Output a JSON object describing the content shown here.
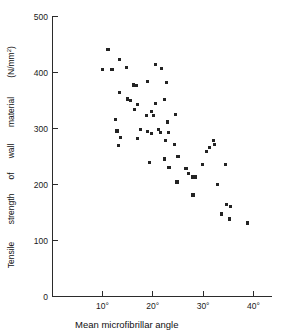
{
  "chart_data": {
    "type": "scatter",
    "title": "",
    "xlabel": "Mean microfibrillar angle",
    "ylabel": "Tensile strength of wall material (N/mm2)",
    "ylabel_words": [
      "Tensile",
      "strength",
      "of",
      "wall",
      "material",
      "(N/mm",
      "2",
      ")"
    ],
    "xtick_labels": [
      "10°",
      "20°",
      "30°",
      "40°"
    ],
    "xticks": [
      10,
      20,
      30,
      40
    ],
    "ytick_labels": [
      "0",
      "100",
      "200",
      "300",
      "400",
      "500"
    ],
    "yticks": [
      0,
      100,
      200,
      300,
      400,
      500
    ],
    "xlim": [
      5,
      42
    ],
    "ylim": [
      0,
      500
    ],
    "grid": false,
    "legend": null,
    "marker": "square",
    "marker_color": "#232323",
    "x_unit": "degrees",
    "y_unit": "N/mm2",
    "points": [
      {
        "x": 11.1,
        "y": 440
      },
      {
        "x": 10.0,
        "y": 404
      },
      {
        "x": 11.9,
        "y": 404
      },
      {
        "x": 13.4,
        "y": 422
      },
      {
        "x": 14.8,
        "y": 408
      },
      {
        "x": 13.3,
        "y": 364
      },
      {
        "x": 15.0,
        "y": 352
      },
      {
        "x": 15.6,
        "y": 349
      },
      {
        "x": 16.2,
        "y": 377
      },
      {
        "x": 16.7,
        "y": 376
      },
      {
        "x": 16.9,
        "y": 342
      },
      {
        "x": 16.3,
        "y": 333
      },
      {
        "x": 19.0,
        "y": 383
      },
      {
        "x": 20.6,
        "y": 413
      },
      {
        "x": 21.7,
        "y": 406
      },
      {
        "x": 22.7,
        "y": 381
      },
      {
        "x": 22.3,
        "y": 351
      },
      {
        "x": 20.6,
        "y": 344
      },
      {
        "x": 19.8,
        "y": 330
      },
      {
        "x": 12.6,
        "y": 315
      },
      {
        "x": 12.9,
        "y": 295
      },
      {
        "x": 13.5,
        "y": 284
      },
      {
        "x": 13.2,
        "y": 269
      },
      {
        "x": 17.5,
        "y": 298
      },
      {
        "x": 17.0,
        "y": 282
      },
      {
        "x": 18.7,
        "y": 322
      },
      {
        "x": 20.1,
        "y": 322
      },
      {
        "x": 18.9,
        "y": 294
      },
      {
        "x": 19.8,
        "y": 290
      },
      {
        "x": 21.1,
        "y": 298
      },
      {
        "x": 21.5,
        "y": 293
      },
      {
        "x": 22.9,
        "y": 311
      },
      {
        "x": 23.1,
        "y": 292
      },
      {
        "x": 22.6,
        "y": 278
      },
      {
        "x": 24.5,
        "y": 324
      },
      {
        "x": 24.3,
        "y": 271
      },
      {
        "x": 25.0,
        "y": 249
      },
      {
        "x": 23.2,
        "y": 230
      },
      {
        "x": 22.3,
        "y": 245
      },
      {
        "x": 19.3,
        "y": 239
      },
      {
        "x": 24.8,
        "y": 204
      },
      {
        "x": 26.6,
        "y": 228
      },
      {
        "x": 27.1,
        "y": 219
      },
      {
        "x": 27.9,
        "y": 213
      },
      {
        "x": 28.4,
        "y": 213
      },
      {
        "x": 28.0,
        "y": 181
      },
      {
        "x": 29.9,
        "y": 236
      },
      {
        "x": 30.6,
        "y": 259
      },
      {
        "x": 31.2,
        "y": 265
      },
      {
        "x": 32.1,
        "y": 278
      },
      {
        "x": 32.3,
        "y": 271
      },
      {
        "x": 32.8,
        "y": 199
      },
      {
        "x": 34.4,
        "y": 235
      },
      {
        "x": 33.6,
        "y": 147
      },
      {
        "x": 34.6,
        "y": 164
      },
      {
        "x": 35.4,
        "y": 160
      },
      {
        "x": 35.2,
        "y": 138
      },
      {
        "x": 38.8,
        "y": 131
      }
    ]
  },
  "axes": {
    "origin_label": "0"
  }
}
